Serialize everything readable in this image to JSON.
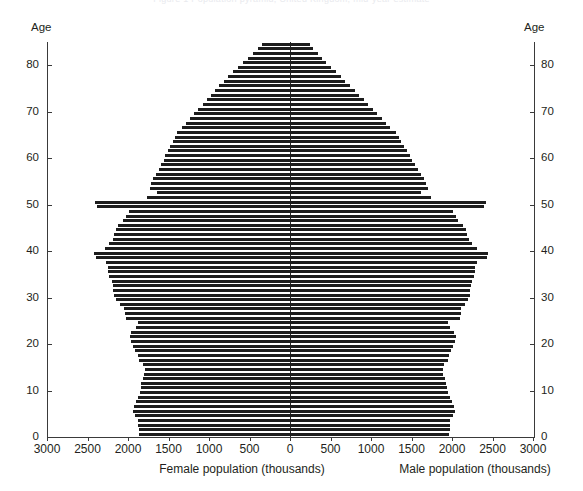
{
  "figure": {
    "clipped_header_text": "Figure 1  Population pyramid, United Kingdom, mid-year estimate",
    "background": "#ffffff",
    "bar_color": "#1d1d1d",
    "axis_color": "#3a3a3a"
  },
  "labels": {
    "age_left": "Age",
    "age_right": "Age",
    "xtitle_left": "Female population (thousands)",
    "xtitle_right": "Male population (thousands)"
  },
  "chart_data": {
    "type": "bar",
    "subtype": "population-pyramid",
    "title": "",
    "xlabel_left": "Female population (thousands)",
    "xlabel_right": "Male population (thousands)",
    "ylabel": "Age",
    "orientation": "horizontal",
    "grid": false,
    "legend": "none",
    "y_axis": {
      "label": "Age",
      "ticks": [
        0,
        10,
        20,
        30,
        40,
        50,
        60,
        70,
        80
      ],
      "ticklabels": [
        "0",
        "10",
        "20",
        "30",
        "40",
        "50",
        "60",
        "70",
        "80"
      ],
      "range": [
        0,
        85
      ],
      "duplicated_on_right": true
    },
    "x_axis": {
      "ticks_left": [
        3000,
        2500,
        2000,
        1500,
        1000,
        500,
        0
      ],
      "ticklabels_left": [
        "3000",
        "2500",
        "2000",
        "1500",
        "1000",
        "500",
        "0"
      ],
      "ticks_right": [
        0,
        500,
        1000,
        1500,
        2000,
        2500,
        3000
      ],
      "ticklabels_right": [
        "0",
        "500",
        "1000",
        "1500",
        "2000",
        "2500",
        "3000"
      ],
      "range": [
        -3000,
        3000
      ],
      "units": "thousands",
      "center": 0
    },
    "ages": [
      0,
      1,
      2,
      3,
      4,
      5,
      6,
      7,
      8,
      9,
      10,
      11,
      12,
      13,
      14,
      15,
      16,
      17,
      18,
      19,
      20,
      21,
      22,
      23,
      24,
      25,
      26,
      27,
      28,
      29,
      30,
      31,
      32,
      33,
      34,
      35,
      36,
      37,
      38,
      39,
      40,
      41,
      42,
      43,
      44,
      45,
      46,
      47,
      48,
      49,
      50,
      51,
      52,
      53,
      54,
      55,
      56,
      57,
      58,
      59,
      60,
      61,
      62,
      63,
      64,
      65,
      66,
      67,
      68,
      69,
      70,
      71,
      72,
      73,
      74,
      75,
      76,
      77,
      78,
      79,
      80,
      81,
      82,
      83,
      84
    ],
    "series": [
      {
        "name": "Female population (thousands)",
        "side": "left",
        "values": [
          1860,
          1870,
          1875,
          1880,
          1915,
          1940,
          1930,
          1900,
          1880,
          1855,
          1845,
          1835,
          1820,
          1800,
          1790,
          1815,
          1870,
          1880,
          1910,
          1940,
          1960,
          1975,
          1960,
          1905,
          1880,
          2030,
          2040,
          2050,
          2100,
          2150,
          2175,
          2180,
          2190,
          2200,
          2235,
          2245,
          2250,
          2270,
          2400,
          2420,
          2290,
          2230,
          2190,
          2170,
          2150,
          2120,
          2060,
          2030,
          1990,
          2380,
          2410,
          1760,
          1640,
          1730,
          1715,
          1690,
          1660,
          1620,
          1590,
          1560,
          1540,
          1510,
          1480,
          1450,
          1420,
          1390,
          1330,
          1280,
          1230,
          1180,
          1130,
          1080,
          1030,
          980,
          930,
          880,
          820,
          760,
          700,
          640,
          580,
          520,
          460,
          400,
          345
        ]
      },
      {
        "name": "Male population (thousands)",
        "side": "right",
        "values": [
          1960,
          1970,
          1975,
          1980,
          2010,
          2035,
          2025,
          1995,
          1975,
          1950,
          1940,
          1930,
          1915,
          1895,
          1885,
          1905,
          1955,
          1965,
          1990,
          2015,
          2035,
          2045,
          2030,
          1975,
          1950,
          2095,
          2105,
          2110,
          2155,
          2200,
          2220,
          2225,
          2235,
          2245,
          2275,
          2285,
          2290,
          2305,
          2430,
          2445,
          2310,
          2250,
          2210,
          2190,
          2170,
          2140,
          2080,
          2050,
          2010,
          2390,
          2415,
          1740,
          1620,
          1700,
          1680,
          1650,
          1615,
          1575,
          1540,
          1505,
          1480,
          1445,
          1410,
          1375,
          1340,
          1305,
          1240,
          1185,
          1130,
          1075,
          1020,
          965,
          910,
          855,
          800,
          745,
          685,
          625,
          565,
          505,
          450,
          395,
          340,
          290,
          245
        ]
      }
    ]
  }
}
